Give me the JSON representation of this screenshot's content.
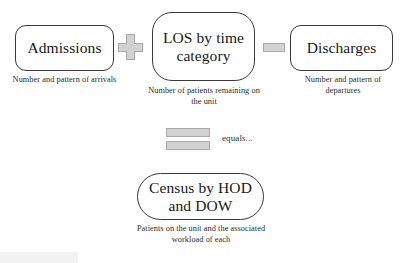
{
  "diagram": {
    "type": "flow-equation",
    "background_color": "#ffffff",
    "box_border_color": "#3a3a3c",
    "operator_fill_color": "#d2d2d2",
    "operator_border_color": "#a9a9a9",
    "text_color": "#18181a",
    "nodes": [
      {
        "id": "admissions",
        "label": "Admissions",
        "caption": "Number and pattern of arrivals",
        "shape": "rounded-rectangle"
      },
      {
        "id": "los",
        "label": "LOS by time category",
        "caption": "Number of patients remaining on the unit",
        "shape": "rounded-rectangle"
      },
      {
        "id": "discharges",
        "label": "Discharges",
        "caption": "Number and pattern of departures",
        "shape": "rounded-rectangle"
      },
      {
        "id": "census",
        "label": "Census by HOD and DOW",
        "caption": "Patients on the unit and the associated workload of each",
        "shape": "pill"
      }
    ],
    "operators": [
      {
        "id": "plus",
        "symbol": "+",
        "name": "plus-operator"
      },
      {
        "id": "minus",
        "symbol": "−",
        "name": "minus-operator"
      },
      {
        "id": "equals",
        "symbol": "=",
        "name": "equals-operator",
        "text": "equals..."
      }
    ],
    "equals_text": "equals..."
  }
}
